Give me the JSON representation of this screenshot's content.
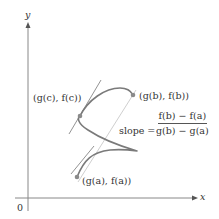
{
  "axes": {
    "x_label": "x",
    "y_label": "y",
    "origin_label": "0"
  },
  "points": {
    "b": "(g(b), f(b))",
    "c": "(g(c), f(c))",
    "a": "(g(a), f(a))"
  },
  "slope": {
    "label": "slope =",
    "numerator": "f(b) − f(a)",
    "denominator": "g(b) − g(a)"
  },
  "colors": {
    "curve": "#7a7a7a",
    "axes": "#888888",
    "tangent": "#777777",
    "secant": "#cfcfcf",
    "point": "#8a8a8a"
  }
}
